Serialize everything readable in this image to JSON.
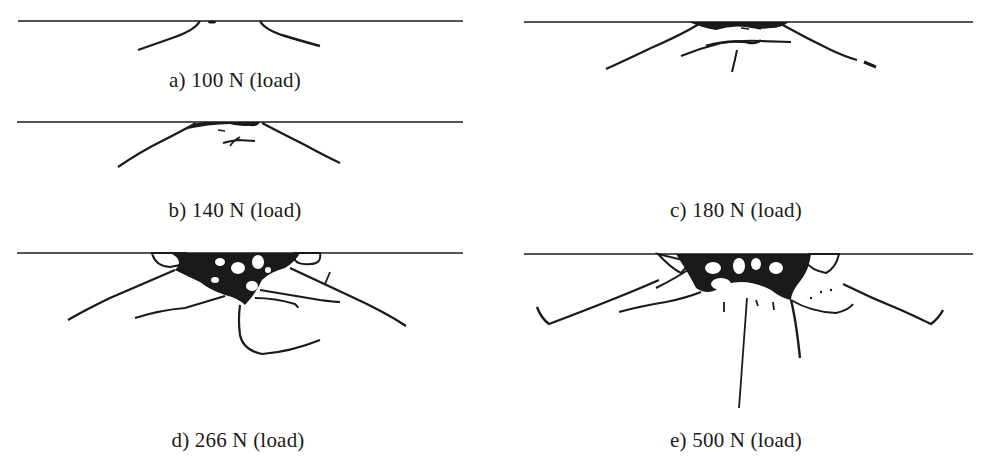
{
  "figure": {
    "panels": [
      {
        "id": "a",
        "caption": "a) 100 N (load)",
        "load_N": 100
      },
      {
        "id": "b",
        "caption": "b) 140 N (load)",
        "load_N": 140
      },
      {
        "id": "c",
        "caption": "c) 180 N (load)",
        "load_N": 180
      },
      {
        "id": "d",
        "caption": "d) 266 N (load)",
        "load_N": 266
      },
      {
        "id": "e",
        "caption": "e) 500 N (load)",
        "load_N": 500
      }
    ],
    "colors": {
      "ink": "#1a1a1a",
      "background": "#ffffff"
    }
  }
}
